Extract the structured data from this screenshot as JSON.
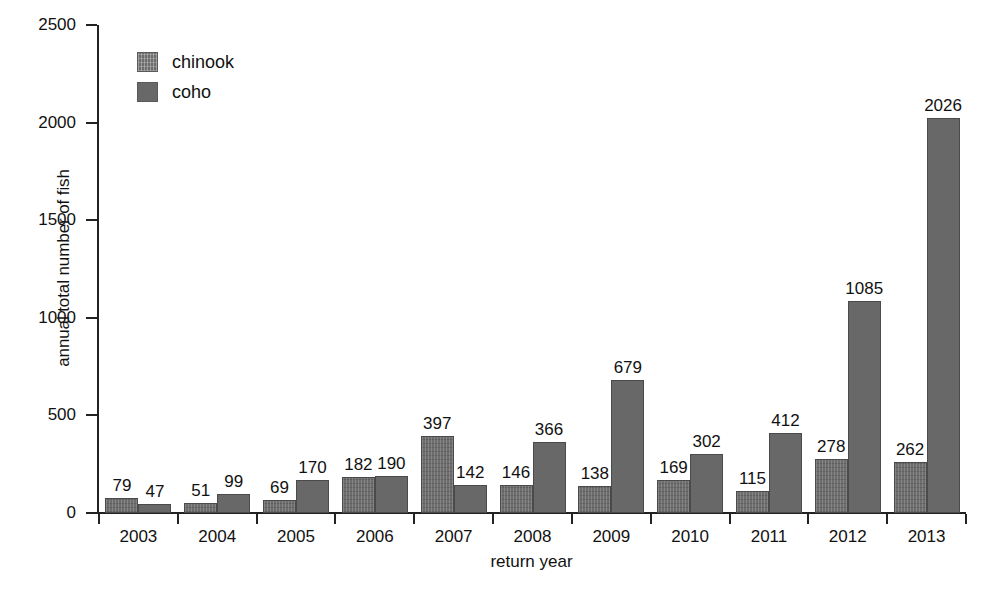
{
  "chart_data": {
    "type": "bar",
    "title": "",
    "xlabel": "return year",
    "ylabel": "annual total number of fish",
    "categories": [
      "2003",
      "2004",
      "2005",
      "2006",
      "2007",
      "2008",
      "2009",
      "2010",
      "2011",
      "2012",
      "2013"
    ],
    "series": [
      {
        "name": "chinook",
        "values": [
          79,
          51,
          69,
          182,
          397,
          146,
          138,
          169,
          115,
          278,
          262
        ],
        "color": "#6d6d6d",
        "fill": "hatched"
      },
      {
        "name": "coho",
        "values": [
          47,
          99,
          170,
          190,
          142,
          366,
          679,
          302,
          412,
          1085,
          2026
        ],
        "color": "#686868",
        "fill": "solid"
      }
    ],
    "ylim": [
      0,
      2500
    ],
    "yticks": [
      0,
      500,
      1000,
      1500,
      2000,
      2500
    ],
    "ytick_labels": [
      "0",
      "500",
      "1000",
      "1500",
      "2000",
      "2500"
    ],
    "grid": false,
    "legend_position": "top-left",
    "data_labels": true,
    "bar_group_mode": "grouped"
  },
  "legend": {
    "items": [
      {
        "label": "chinook"
      },
      {
        "label": "coho"
      }
    ]
  },
  "axes": {
    "y_label": "annual total number of fish",
    "x_label": "return year"
  }
}
